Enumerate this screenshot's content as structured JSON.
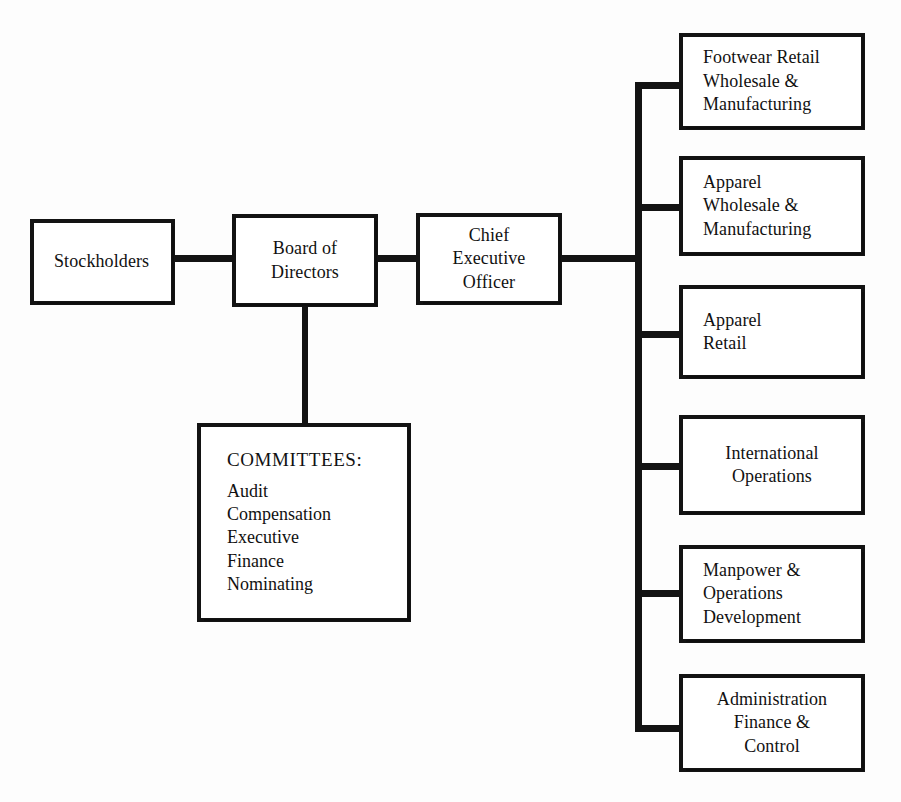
{
  "diagram": {
    "type": "organizational-chart",
    "background_color": "#fdfdfd",
    "line_color": "#131313",
    "box_fill_color": "#ffffff"
  },
  "nodes": {
    "stockholders": {
      "label": "Stockholders",
      "align": "left"
    },
    "board_of_directors": {
      "label": "Board of\nDirectors",
      "align": "center"
    },
    "chief_executive_officer": {
      "label": "Chief\nExecutive\nOfficer",
      "align": "center"
    },
    "committees": {
      "heading": "COMMITTEES:",
      "items": "Audit\nCompensation\nExecutive\nFinance\nNominating",
      "align": "left"
    }
  },
  "divisions": [
    {
      "id": "footwear-retail-wholesale-manufacturing",
      "label": "Footwear Retail\nWholesale &\nManufacturing",
      "align": "left"
    },
    {
      "id": "apparel-wholesale-manufacturing",
      "label": "Apparel\nWholesale &\nManufacturing",
      "align": "left"
    },
    {
      "id": "apparel-retail",
      "label": "Apparel\nRetail",
      "align": "left"
    },
    {
      "id": "international-operations",
      "label": "International\nOperations",
      "align": "center"
    },
    {
      "id": "manpower-operations-development",
      "label": "Manpower &\nOperations\nDevelopment",
      "align": "left"
    },
    {
      "id": "administration-finance-control",
      "label": "Administration\nFinance &\nControl",
      "align": "center"
    }
  ]
}
